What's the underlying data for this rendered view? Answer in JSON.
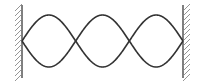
{
  "diagram": {
    "type": "standing-wave",
    "harmonic": 3,
    "loops": 3,
    "nodes_x": [
      22,
      75.7,
      129.3,
      183
    ],
    "center_y": 41,
    "amplitude": 26,
    "colors": {
      "wave": "#333333",
      "wall": "#555555",
      "hatch": "#8a8a8a",
      "background": "#ffffff"
    },
    "walls": [
      {
        "side": "left",
        "x": 22,
        "y_top": 5,
        "y_bottom": 78,
        "hatch_side": "left"
      },
      {
        "side": "right",
        "x": 183,
        "y_top": 5,
        "y_bottom": 78,
        "hatch_side": "right"
      }
    ]
  }
}
